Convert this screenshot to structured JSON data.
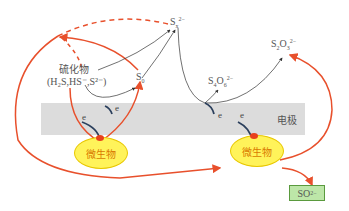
{
  "diagram": {
    "electrode_label": "电极",
    "microbe_label": "微生物",
    "electron_label": "e",
    "sulfide": {
      "title": "硫化物",
      "species": "(H₂S,HS⁻,S²⁻)"
    },
    "species": {
      "polysulfide": {
        "base": "S",
        "sub": "x",
        "sup": "2−"
      },
      "sulfur": {
        "base": "S",
        "sub": "0"
      },
      "tetrathionate": {
        "base": "S",
        "sub": "4",
        "mid": "O",
        "sub2": "6",
        "sup": "2−"
      },
      "thiosulfate": {
        "base": "S",
        "sub": "2",
        "mid": "O",
        "sub2": "3",
        "sup": "2−"
      },
      "sulfate": {
        "base": "SO",
        "sup": "2−",
        "sub": "4"
      }
    },
    "colors": {
      "red_arrow": "#e8502c",
      "dark_arrow": "#333333",
      "electrode": "#dcdcdc",
      "microbe_fill": "#fff35a",
      "sulfate_box": "#bde6a8"
    }
  }
}
